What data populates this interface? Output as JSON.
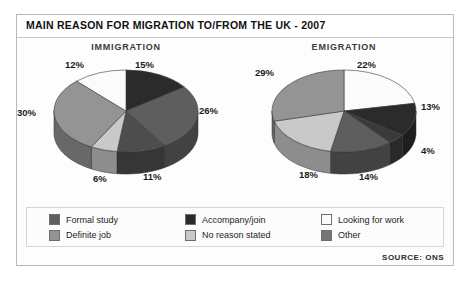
{
  "figure": {
    "title": "MAIN REASON FOR MIGRATION TO/FROM THE UK - 2007",
    "source": "SOURCE: ONS"
  },
  "legend": {
    "items": [
      {
        "label": "Formal study",
        "color": "#5e5e5e"
      },
      {
        "label": "Accompany/join",
        "color": "#2b2b2b"
      },
      {
        "label": "Looking for work",
        "color": "#fbfbfb"
      },
      {
        "label": "Definite job",
        "color": "#949494"
      },
      {
        "label": "No reason stated",
        "color": "#c9c9c9"
      },
      {
        "label": "Other",
        "color": "#767676"
      }
    ]
  },
  "chart_data": [
    {
      "type": "pie",
      "title": "IMMIGRATION",
      "categories": [
        "Accompany/join",
        "Formal study",
        "Definite job",
        "No reason stated",
        "Other",
        "Looking for work"
      ],
      "values": [
        15,
        26,
        11,
        6,
        30,
        12
      ],
      "labels": [
        "15%",
        "26%",
        "11%",
        "6%",
        "30%",
        "12%"
      ],
      "colors": [
        "#2b2b2b",
        "#5e5e5e",
        "#4d4d4d",
        "#c9c9c9",
        "#949494",
        "#fbfbfb"
      ],
      "legend_position": "bottom-shared"
    },
    {
      "type": "pie",
      "title": "EMIGRATION",
      "categories": [
        "Looking for work",
        "Accompany/join",
        "Formal study",
        "Definite job",
        "No reason stated",
        "Other"
      ],
      "values": [
        22,
        13,
        4,
        14,
        18,
        29
      ],
      "labels": [
        "22%",
        "13%",
        "4%",
        "14%",
        "18%",
        "29%"
      ],
      "colors": [
        "#fbfbfb",
        "#2b2b2b",
        "#3a3a3a",
        "#5e5e5e",
        "#c9c9c9",
        "#949494"
      ],
      "legend_position": "bottom-shared"
    }
  ]
}
